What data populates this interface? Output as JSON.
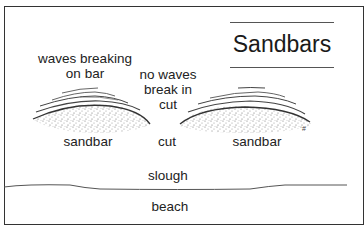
{
  "title": "Sandbars",
  "labels": {
    "waves_breaking_line1": "waves breaking",
    "waves_breaking_line2": "on bar",
    "no_waves_line1": "no waves",
    "no_waves_line2": "break in",
    "no_waves_line3": "cut",
    "sandbar_left": "sandbar",
    "cut": "cut",
    "sandbar_right": "sandbar",
    "slough": "slough",
    "beach": "beach"
  },
  "colors": {
    "line": "#333333",
    "stipple": "#8a8a8a",
    "background": "#ffffff"
  }
}
